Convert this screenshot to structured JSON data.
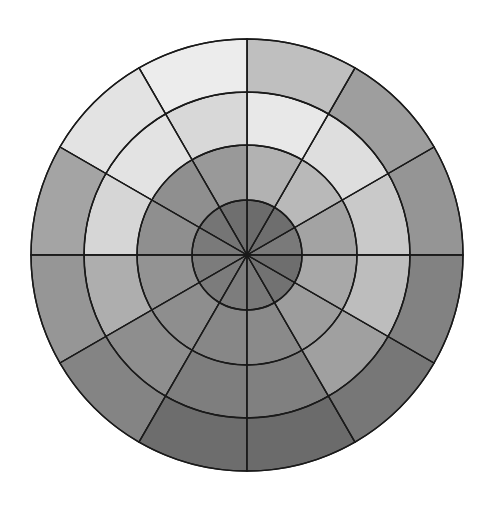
{
  "figure": {
    "background_color": "#ffffff",
    "line_color": "#1a1a1a",
    "center_x": 247,
    "center_y": 255,
    "width": 491,
    "height": 506
  },
  "chart_data": {
    "type": "heatmap",
    "subtype": "polar-sector-grid",
    "title": "",
    "subtitle": "",
    "xlabel": "",
    "ylabel": "",
    "legend": [],
    "annotations": [],
    "grid": true,
    "colorscale": "grayscale",
    "angular_sector_count": 12,
    "angular_sector_width_deg": 30,
    "radial_ring_count": 4,
    "radial_boundaries_px": [
      0,
      55,
      110,
      163,
      216
    ],
    "theta_start_deg": 0,
    "theta_direction": "counterclockwise",
    "angle_bin_starts_deg": [
      0,
      30,
      60,
      90,
      120,
      150,
      180,
      210,
      240,
      270,
      300,
      330
    ],
    "ring_labels": [
      "ring-1-inner",
      "ring-2",
      "ring-3",
      "ring-4-outer"
    ],
    "cells": [
      {
        "ring": 0,
        "ring_name": "ring-1-inner",
        "r_inner": 0,
        "r_outer": 55,
        "sector_colors": [
          "#7a7a7a",
          "#6e6e6e",
          "#6c6c6c",
          "#6f6f6f",
          "#757575",
          "#7a7a7a",
          "#7c7c7c",
          "#7c7c7c",
          "#7d7d7d",
          "#797979",
          "#727272",
          "#6e6e6e"
        ],
        "sector_values": [
          48,
          43,
          42,
          44,
          46,
          48,
          49,
          49,
          49,
          47,
          45,
          43
        ]
      },
      {
        "ring": 1,
        "ring_name": "ring-2",
        "r_inner": 55,
        "r_outer": 110,
        "sector_colors": [
          "#a3a3a3",
          "#b9b9b9",
          "#b2b2b2",
          "#999999",
          "#8f8f8f",
          "#8f8f8f",
          "#939393",
          "#8e8e8e",
          "#878787",
          "#8a8a8a",
          "#9d9d9d",
          "#a8a8a8"
        ],
        "sector_values": [
          64,
          73,
          70,
          60,
          56,
          56,
          58,
          56,
          53,
          54,
          62,
          66
        ]
      },
      {
        "ring": 2,
        "ring_name": "ring-3",
        "r_inner": 110,
        "r_outer": 163,
        "sector_colors": [
          "#c9c9c9",
          "#dedede",
          "#e8e8e8",
          "#d8d8d8",
          "#e3e3e3",
          "#d6d6d6",
          "#aeaeae",
          "#8e8e8e",
          "#7e7e7e",
          "#808080",
          "#a0a0a0",
          "#bdbdbd"
        ],
        "sector_values": [
          79,
          87,
          91,
          85,
          89,
          84,
          68,
          56,
          49,
          50,
          63,
          74
        ]
      },
      {
        "ring": 3,
        "ring_name": "ring-4-outer",
        "r_inner": 163,
        "r_outer": 216,
        "sector_colors": [
          "#959595",
          "#9e9e9e",
          "#bfbfbf",
          "#ececec",
          "#e3e3e3",
          "#a4a4a4",
          "#969696",
          "#848484",
          "#6d6d6d",
          "#6b6b6b",
          "#777777",
          "#828282"
        ],
        "sector_values": [
          58,
          62,
          75,
          93,
          89,
          64,
          59,
          52,
          43,
          42,
          47,
          51
        ]
      }
    ]
  }
}
